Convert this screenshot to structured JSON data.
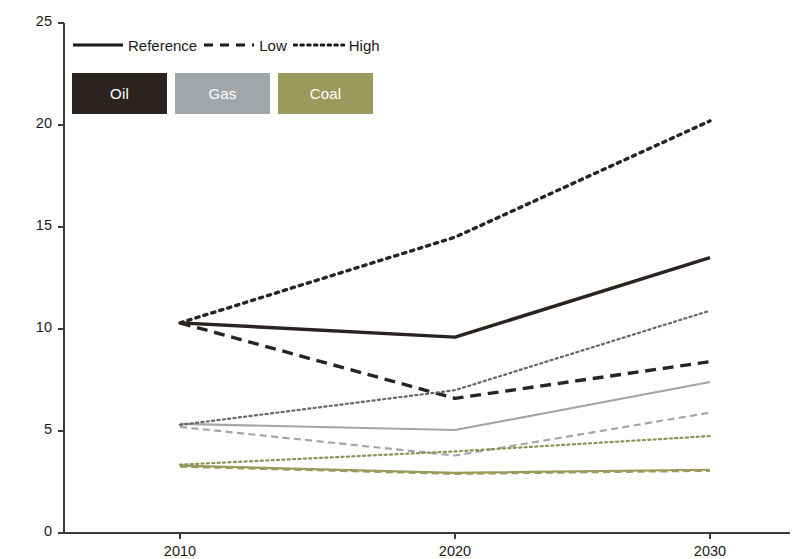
{
  "chart_data": {
    "type": "line",
    "title": "",
    "subtitle": "",
    "xlabel": "",
    "ylabel": "Fossil fuel price (€ GJ⁻¹)",
    "x": [
      2010,
      2020,
      2030
    ],
    "xtick_labels": [
      "2010",
      "2020",
      "2030"
    ],
    "ytick_labels": [
      "0",
      "5",
      "10",
      "15",
      "20",
      "25"
    ],
    "ytick_values": [
      0,
      5,
      10,
      15,
      20,
      25
    ],
    "xlim": [
      2010,
      2030
    ],
    "ylim": [
      0,
      25
    ],
    "grid": false,
    "legend_position": "top-left",
    "legend_style_entries": [
      {
        "label": "Reference",
        "dash": "solid"
      },
      {
        "label": "Low",
        "dash": "dashed"
      },
      {
        "label": "High",
        "dash": "dotted"
      }
    ],
    "legend_fuel_entries": [
      {
        "label": "Oil",
        "color": "#2a2320"
      },
      {
        "label": "Gas",
        "color": "#a3a6a9"
      },
      {
        "label": "Coal",
        "color": "#9a9a5c"
      }
    ],
    "series": [
      {
        "name": "Oil Reference",
        "fuel": "Oil",
        "scenario": "Reference",
        "color": "#2a2320",
        "dash": "solid",
        "values": [
          10.3,
          9.6,
          13.5
        ]
      },
      {
        "name": "Oil Low",
        "fuel": "Oil",
        "scenario": "Low",
        "color": "#2a2320",
        "dash": "dashed",
        "values": [
          10.3,
          6.6,
          8.4
        ]
      },
      {
        "name": "Oil High",
        "fuel": "Oil",
        "scenario": "High",
        "color": "#2a2320",
        "dash": "dotted",
        "values": [
          10.3,
          14.5,
          20.2
        ]
      },
      {
        "name": "Gas Reference",
        "fuel": "Gas",
        "scenario": "Reference",
        "color": "#a3a6a9",
        "dash": "solid",
        "values": [
          5.35,
          5.05,
          7.4
        ]
      },
      {
        "name": "Gas Low",
        "fuel": "Gas",
        "scenario": "Low",
        "color": "#a3a6a9",
        "dash": "dashed",
        "values": [
          5.2,
          3.8,
          5.9
        ]
      },
      {
        "name": "Gas High",
        "fuel": "Gas",
        "scenario": "High",
        "color": "#666666",
        "dash": "dotted",
        "values": [
          5.3,
          7.0,
          10.9
        ]
      },
      {
        "name": "Coal Reference",
        "fuel": "Coal",
        "scenario": "Reference",
        "color": "#9a9a5c",
        "dash": "solid",
        "values": [
          3.3,
          2.95,
          3.1
        ]
      },
      {
        "name": "Coal Low",
        "fuel": "Coal",
        "scenario": "Low",
        "color": "#9a9a5c",
        "dash": "dashed",
        "values": [
          3.25,
          2.9,
          3.05
        ]
      },
      {
        "name": "Coal High",
        "fuel": "Coal",
        "scenario": "High",
        "color": "#8f8f56",
        "dash": "dotted",
        "values": [
          3.35,
          4.0,
          4.75
        ]
      }
    ]
  }
}
